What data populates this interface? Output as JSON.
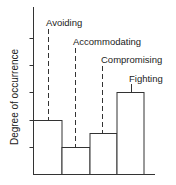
{
  "chart_data": {
    "type": "bar",
    "title": "",
    "xlabel": "",
    "ylabel": "Degree of occurrence",
    "categories": [
      "Avoiding",
      "Accommodating",
      "Compromising",
      "Fighting"
    ],
    "values": [
      2,
      1,
      1.5,
      3
    ],
    "ylim": [
      0,
      6
    ],
    "y_ticks": [
      1,
      2,
      3,
      4,
      5
    ],
    "y_tick_labels_shown": false,
    "grid": false,
    "legend": null,
    "bar_style": {
      "fill": "#ffffff",
      "stroke": "#333333",
      "adjacent_bars": true
    },
    "annotations": [
      {
        "text": "Avoiding",
        "leader": "dashed",
        "target_index": 0
      },
      {
        "text": "Accommodating",
        "leader": "dashed",
        "target_index": 1
      },
      {
        "text": "Compromising",
        "leader": "dashed",
        "target_index": 2
      },
      {
        "text": "Fighting",
        "leader": "solid",
        "target_index": 3
      }
    ]
  },
  "colors": {
    "axis": "#333333",
    "text": "#222222",
    "background": "#ffffff"
  }
}
